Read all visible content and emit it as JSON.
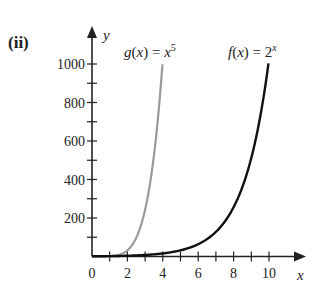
{
  "panel_label": "(ii)",
  "chart_data": {
    "type": "line",
    "title": "",
    "xlabel": "x",
    "ylabel": "y",
    "xlim": [
      0,
      11
    ],
    "ylim": [
      0,
      1100
    ],
    "x_ticks": [
      0,
      1,
      2,
      3,
      4,
      5,
      6,
      7,
      8,
      9,
      10
    ],
    "x_tick_labels": [
      "0",
      "2",
      "4",
      "6",
      "8",
      "10"
    ],
    "y_ticks": [
      100,
      200,
      300,
      400,
      500,
      600,
      700,
      800,
      900,
      1000
    ],
    "y_tick_labels": [
      "200",
      "400",
      "600",
      "800",
      "1000"
    ],
    "grid": false,
    "series": [
      {
        "name": "g(x) = x^5",
        "label_main": "g(x) = x",
        "label_sup": "5",
        "color": "#9a9a9a",
        "x_range": [
          0,
          3.98
        ],
        "formula": "x^5"
      },
      {
        "name": "f(x) = 2^x",
        "label_main": "f(x) = 2",
        "label_sup": "x",
        "color": "#111111",
        "x_range": [
          0,
          9.97
        ],
        "formula": "2^x"
      }
    ]
  },
  "colors": {
    "axis": "#222222",
    "g": "#9a9a9a",
    "f": "#111111"
  }
}
